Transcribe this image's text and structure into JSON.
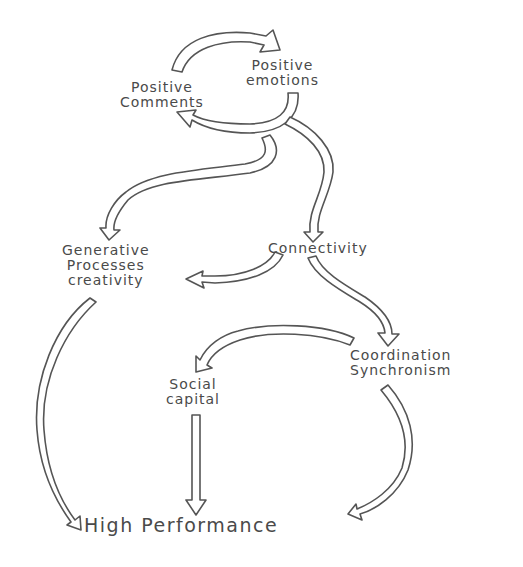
{
  "diagram": {
    "style": "hand-drawn flow diagram",
    "stroke_color": "#555555",
    "text_color": "#4a4a4a",
    "background": "#ffffff",
    "nodes": {
      "positive_comments": {
        "line1": "Positive",
        "line2": "Comments"
      },
      "positive_emotions": {
        "line1": "Positive",
        "line2": "emotions"
      },
      "generative": {
        "line1": "Generative",
        "line2": "Processes",
        "line3": "creativity"
      },
      "connectivity": {
        "line1": "Connectivity"
      },
      "coordination": {
        "line1": "Coordination",
        "line2": "Synchronism"
      },
      "social_capital": {
        "line1": "Social",
        "line2": "capital"
      },
      "high_performance": {
        "line1": "High Performance"
      }
    },
    "edges": [
      {
        "from": "Positive Comments",
        "to": "Positive emotions"
      },
      {
        "from": "Positive emotions",
        "to": "Positive Comments"
      },
      {
        "from": "Positive emotions",
        "to": "Generative Processes creativity"
      },
      {
        "from": "Positive emotions",
        "to": "Connectivity"
      },
      {
        "from": "Connectivity",
        "to": "Generative Processes creativity"
      },
      {
        "from": "Connectivity",
        "to": "Coordination Synchronism"
      },
      {
        "from": "Coordination Synchronism",
        "to": "Social capital"
      },
      {
        "from": "Generative Processes creativity",
        "to": "High Performance"
      },
      {
        "from": "Social capital",
        "to": "High Performance"
      },
      {
        "from": "Coordination Synchronism",
        "to": "High Performance"
      }
    ]
  }
}
